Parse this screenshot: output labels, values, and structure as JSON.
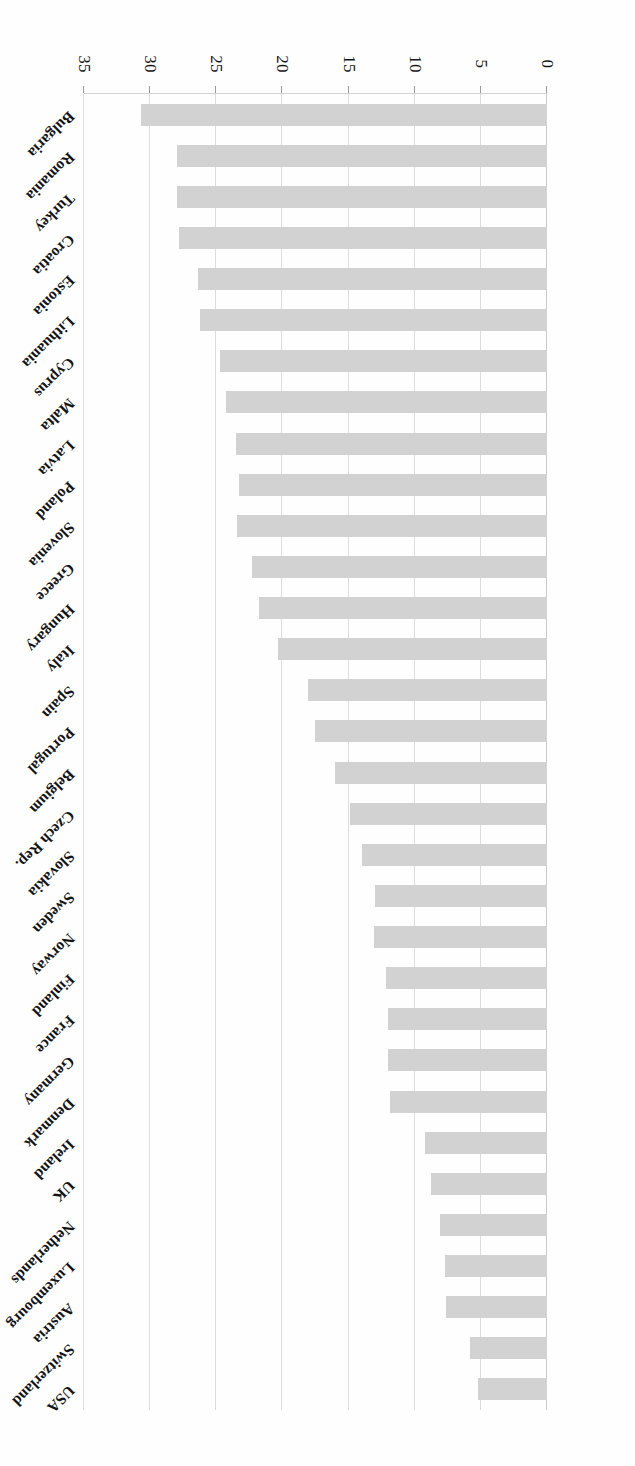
{
  "figure": {
    "orientation": "rotated-180",
    "bar_color": "#d2d2d2",
    "gridline_color": "#dcdcdc",
    "axis_color": "#d2d2d2"
  },
  "chart_data": {
    "type": "bar",
    "title": "",
    "xlabel": "",
    "ylabel": "",
    "orientation": "horizontal",
    "xlim": [
      0,
      35
    ],
    "grid": true,
    "legend": false,
    "tick_labels": [
      "0",
      "5",
      "10",
      "15",
      "20",
      "25",
      "30",
      "35"
    ],
    "ticks": [
      0,
      5,
      10,
      15,
      20,
      25,
      30,
      35
    ],
    "categories": [
      "Bulgaria",
      "Romania",
      "Turkey",
      "Croatia",
      "Estonia",
      "Lithuania",
      "Cyprus",
      "Malta",
      "Latvia",
      "Poland",
      "Slovenia",
      "Greece",
      "Hungary",
      "Italy",
      "Spain",
      "Portugal",
      "Belgium",
      "Czech Rep.",
      "Slovakia",
      "Sweden",
      "Norway",
      "Finland",
      "France",
      "Germany",
      "Denmark",
      "Ireland",
      "UK",
      "Netherlands",
      "Luxembourg",
      "Austria",
      "Switzerland",
      "USA"
    ],
    "values": [
      30.7,
      28.0,
      28.0,
      27.8,
      26.4,
      26.2,
      24.7,
      24.3,
      23.5,
      23.3,
      23.4,
      22.3,
      21.8,
      20.3,
      18.1,
      17.5,
      16.0,
      14.9,
      14.0,
      13.0,
      13.1,
      12.2,
      12.0,
      12.0,
      11.9,
      9.2,
      8.8,
      8.1,
      7.7,
      7.6,
      5.8,
      5.2
    ]
  }
}
